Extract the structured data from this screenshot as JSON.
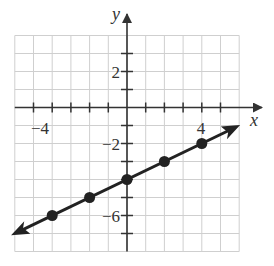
{
  "chart_data": {
    "type": "line",
    "title": "",
    "xlabel": "x",
    "ylabel": "y",
    "xlim": [
      -6,
      6
    ],
    "ylim": [
      -8,
      4
    ],
    "grid": true,
    "x_tick_labels": [
      {
        "value": -4,
        "label": "−4"
      },
      {
        "value": 4,
        "label": "4"
      }
    ],
    "y_tick_labels": [
      {
        "value": 2,
        "label": "2"
      },
      {
        "value": -2,
        "label": "−2"
      },
      {
        "value": -6,
        "label": "−6"
      }
    ],
    "series": [
      {
        "name": "line",
        "equation": "y = x/2 - 4",
        "points": [
          {
            "x": -4,
            "y": -6
          },
          {
            "x": -2,
            "y": -5
          },
          {
            "x": 0,
            "y": -4
          },
          {
            "x": 2,
            "y": -3
          },
          {
            "x": 4,
            "y": -2
          }
        ],
        "arrows": "both"
      }
    ],
    "colors": {
      "line": "#222222",
      "grid": "#c8c8c8",
      "axis": "#333333"
    }
  },
  "labels": {
    "x_axis": "x",
    "y_axis": "y",
    "tick_x_neg4": "−4",
    "tick_x_4": "4",
    "tick_y_2": "2",
    "tick_y_neg2": "−2",
    "tick_y_neg6": "−6"
  }
}
